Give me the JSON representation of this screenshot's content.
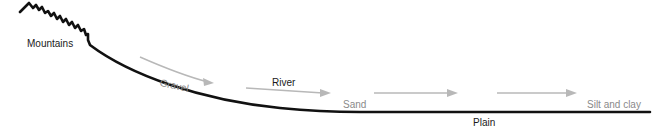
{
  "diagram": {
    "labels": {
      "mountains": "Mountains",
      "gravel": "Gravel",
      "river": "River",
      "sand": "Sand",
      "plain": "Plain",
      "silt_clay": "Silt and clay"
    },
    "colors": {
      "terrain": "#111111",
      "flow_arrows": "#b8b8b8",
      "sediment_text": "#8a8a8a",
      "label_text": "#1a1a1a"
    },
    "flow_arrows": [
      {
        "name": "flow-arrow-1"
      },
      {
        "name": "flow-arrow-2"
      },
      {
        "name": "flow-arrow-3"
      },
      {
        "name": "flow-arrow-4"
      },
      {
        "name": "flow-arrow-5"
      }
    ]
  }
}
